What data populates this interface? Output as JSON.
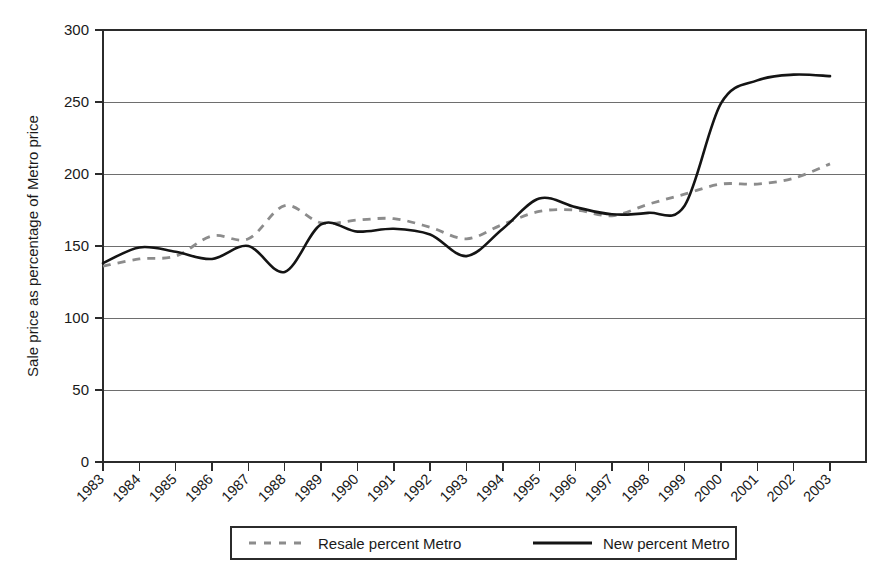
{
  "chart_data": {
    "type": "line",
    "title": "",
    "xlabel": "",
    "ylabel": "Sale price as percentage of Metro price",
    "ylim": [
      0,
      300
    ],
    "yticks": [
      0,
      50,
      100,
      150,
      200,
      250,
      300
    ],
    "grid": true,
    "legend_position": "bottom",
    "x": [
      1983,
      1984,
      1985,
      1986,
      1987,
      1988,
      1989,
      1990,
      1991,
      1992,
      1993,
      1994,
      1995,
      1996,
      1997,
      1998,
      1999,
      2000,
      2001,
      2002,
      2003
    ],
    "categories": [
      "1983",
      "1984",
      "1985",
      "1986",
      "1987",
      "1988",
      "1989",
      "1990",
      "1991",
      "1992",
      "1993",
      "1994",
      "1995",
      "1996",
      "1997",
      "1998",
      "1999",
      "2000",
      "2001",
      "2002",
      "2003"
    ],
    "series": [
      {
        "name": "Resale percent Metro",
        "style": "dashed",
        "color": "#8c8c8c",
        "values": [
          136,
          141,
          143,
          157,
          155,
          178,
          166,
          168,
          169,
          163,
          155,
          165,
          174,
          175,
          171,
          179,
          186,
          193,
          193,
          197,
          207
        ]
      },
      {
        "name": "New percent Metro",
        "style": "solid",
        "color": "#141414",
        "values": [
          138,
          149,
          146,
          141,
          150,
          132,
          165,
          160,
          162,
          158,
          143,
          162,
          183,
          177,
          172,
          173,
          178,
          249,
          265,
          269,
          268
        ]
      }
    ]
  },
  "legend": {
    "items": [
      {
        "label": "Resale percent Metro",
        "style": "dashed"
      },
      {
        "label": "New percent Metro",
        "style": "solid"
      }
    ]
  },
  "axes": {
    "y_title": "Sale price as percentage of Metro price",
    "y_tick_labels": [
      "300",
      "250",
      "200",
      "150",
      "100",
      "50",
      "0"
    ],
    "x_tick_labels": [
      "1983",
      "1984",
      "1985",
      "1986",
      "1987",
      "1988",
      "1989",
      "1990",
      "1991",
      "1992",
      "1993",
      "1994",
      "1995",
      "1996",
      "1997",
      "1998",
      "1999",
      "2000",
      "2001",
      "2002",
      "2003"
    ]
  },
  "colors": {
    "background": "#ffffff",
    "grid": "#6e6e6e",
    "frame": "#2b2b2b",
    "solid_series": "#141414",
    "dashed_series": "#8c8c8c"
  }
}
